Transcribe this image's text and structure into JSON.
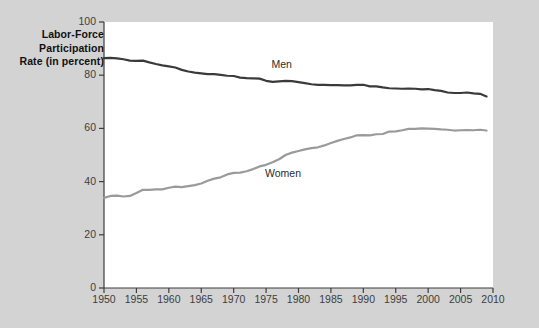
{
  "chart_data": {
    "type": "line",
    "title": "",
    "ylabel": "Labor-Force Participation Rate (in percent)",
    "ylabel_lines": [
      "Labor-Force",
      "Participation",
      "Rate (in percent)"
    ],
    "xlabel": "",
    "xlim": [
      1950,
      2010
    ],
    "ylim": [
      0,
      100
    ],
    "yticks": [
      0,
      20,
      40,
      60,
      80,
      100
    ],
    "xticks": [
      1950,
      1955,
      1960,
      1965,
      1970,
      1975,
      1980,
      1985,
      1990,
      1995,
      2000,
      2005,
      2010
    ],
    "grid": false,
    "legend": "inline-labels",
    "x": [
      1950,
      1951,
      1952,
      1953,
      1954,
      1955,
      1956,
      1957,
      1958,
      1959,
      1960,
      1961,
      1962,
      1963,
      1964,
      1965,
      1966,
      1967,
      1968,
      1969,
      1970,
      1971,
      1972,
      1973,
      1974,
      1975,
      1976,
      1977,
      1978,
      1979,
      1980,
      1981,
      1982,
      1983,
      1984,
      1985,
      1986,
      1987,
      1988,
      1989,
      1990,
      1991,
      1992,
      1993,
      1994,
      1995,
      1996,
      1997,
      1998,
      1999,
      2000,
      2001,
      2002,
      2003,
      2004,
      2005,
      2006,
      2007,
      2008,
      2009
    ],
    "series": [
      {
        "name": "Men",
        "color": "#3a3a3a",
        "label_x": 1978,
        "label_y": 84,
        "values": [
          86.4,
          86.5,
          86.3,
          86.0,
          85.5,
          85.4,
          85.5,
          84.8,
          84.2,
          83.7,
          83.3,
          82.9,
          82.0,
          81.4,
          81.0,
          80.7,
          80.4,
          80.4,
          80.1,
          79.8,
          79.7,
          79.1,
          78.9,
          78.8,
          78.7,
          77.9,
          77.5,
          77.7,
          77.9,
          77.8,
          77.4,
          77.0,
          76.6,
          76.4,
          76.4,
          76.3,
          76.3,
          76.2,
          76.2,
          76.4,
          76.4,
          75.8,
          75.8,
          75.4,
          75.1,
          75.0,
          74.9,
          75.0,
          74.9,
          74.7,
          74.8,
          74.4,
          74.1,
          73.5,
          73.3,
          73.3,
          73.5,
          73.2,
          73.0,
          72.0
        ]
      },
      {
        "name": "Women",
        "color": "#9a9a9a",
        "label_x": 1977,
        "label_y": 43,
        "values": [
          33.9,
          34.6,
          34.7,
          34.4,
          34.6,
          35.7,
          36.9,
          36.9,
          37.1,
          37.1,
          37.7,
          38.1,
          37.9,
          38.3,
          38.7,
          39.3,
          40.3,
          41.1,
          41.6,
          42.7,
          43.3,
          43.4,
          43.9,
          44.7,
          45.7,
          46.3,
          47.3,
          48.4,
          50.0,
          50.9,
          51.5,
          52.1,
          52.6,
          52.9,
          53.6,
          54.5,
          55.3,
          56.0,
          56.6,
          57.4,
          57.5,
          57.4,
          57.8,
          57.9,
          58.8,
          58.9,
          59.3,
          59.8,
          59.8,
          60.0,
          59.9,
          59.8,
          59.6,
          59.5,
          59.2,
          59.3,
          59.4,
          59.3,
          59.5,
          59.2
        ]
      }
    ]
  }
}
